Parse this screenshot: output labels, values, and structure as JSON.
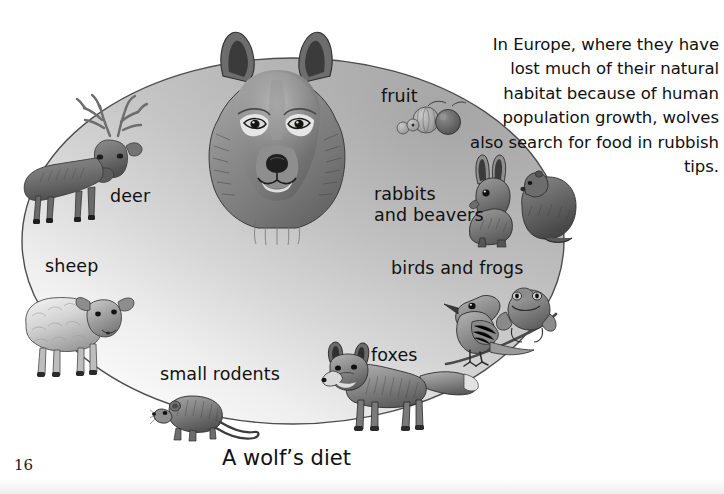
{
  "page": {
    "number": "16",
    "caption": "A wolf’s diet",
    "background_color": "#ffffff",
    "text_color": "#111111"
  },
  "diagram": {
    "name": "wolf-diet-ellipse",
    "shape": "ellipse",
    "fill_gradient_from": "#b4b4b4",
    "fill_gradient_to": "#fdfdfd",
    "stroke_color": "#555555",
    "center_illustration": "wolf-head"
  },
  "labels": [
    {
      "id": "deer",
      "text": "deer"
    },
    {
      "id": "sheep",
      "text": "sheep"
    },
    {
      "id": "fruit",
      "text": "fruit"
    },
    {
      "id": "rabbits",
      "text": "rabbits\nand beavers"
    },
    {
      "id": "birds",
      "text": "birds and frogs"
    },
    {
      "id": "foxes",
      "text": "foxes"
    },
    {
      "id": "small_rodents",
      "text": "small rodents"
    }
  ],
  "sidebar_text": {
    "paragraph": "In Europe, where they have lost much of their natural habitat because of human population growth, wolves also search for food in rubbish tips.",
    "alignment": "right"
  },
  "illustrations": [
    {
      "id": "wolf-head",
      "label": "wolf head, front view, grayscale drawing"
    },
    {
      "id": "deer",
      "label": "red deer stag with antlers"
    },
    {
      "id": "sheep",
      "label": "sheep standing"
    },
    {
      "id": "fruit",
      "label": "berries and round fruit"
    },
    {
      "id": "rabbit-beaver",
      "label": "rabbit sitting beside a beaver"
    },
    {
      "id": "bird-frog",
      "label": "small bird perched with a frog"
    },
    {
      "id": "fox",
      "label": "fox standing in profile"
    },
    {
      "id": "rodent",
      "label": "mouse or vole walking"
    }
  ]
}
